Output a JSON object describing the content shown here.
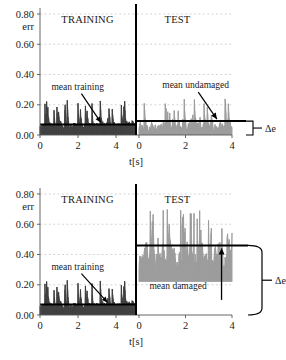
{
  "figure": {
    "width": 286,
    "height": 360,
    "background": "#ffffff"
  },
  "colors": {
    "training_trace": "#3a3a3a",
    "test_trace": "#9a9a9a",
    "mean_line": "#000000",
    "axis": "#555555",
    "grid": "#bbbbbb",
    "text": "#1a1a1a",
    "divider": "#000000"
  },
  "chart_data": [
    {
      "id": "top",
      "type": "line",
      "title": "",
      "xlabel": "t[s]",
      "ylabel": "err",
      "ylim": [
        0.0,
        0.8
      ],
      "yticks": [
        0.0,
        0.2,
        0.4,
        0.6,
        0.8
      ],
      "ytick_labels": [
        "0.00",
        "0.20",
        "0.40",
        "0.60",
        "0.80"
      ],
      "grid": true,
      "legend": "none",
      "segments": [
        {
          "name": "TRAINING",
          "label": "TRAINING",
          "xlim": [
            0,
            5
          ],
          "xticks": [
            0,
            2,
            4
          ],
          "xtick_labels": [
            "0",
            "2",
            "4"
          ],
          "trace_color": "#3a3a3a",
          "noise_seed": 17,
          "noise_base": 0.035,
          "noise_amplitude": 0.115,
          "noise_spike_chance": 0.12,
          "noise_spike_max": 0.23,
          "mean_value": 0.07,
          "mean_label": "mean training"
        },
        {
          "name": "TEST",
          "label": "TEST",
          "xlim": [
            0,
            4
          ],
          "xticks": [
            0,
            2,
            4
          ],
          "xtick_labels": [
            "0",
            "2",
            "4"
          ],
          "trace_color": "#9a9a9a",
          "noise_seed": 41,
          "noise_base": 0.005,
          "noise_amplitude": 0.185,
          "noise_spike_chance": 0.18,
          "noise_spike_max": 0.245,
          "mean_value": 0.092,
          "mean_label": "mean undamaged"
        }
      ],
      "annotations": [
        {
          "id": "mean-training",
          "text": "mean training",
          "x": 0.6,
          "y": 0.3
        },
        {
          "id": "mean-undamaged",
          "text": "mean undamaged",
          "x": 1.0,
          "y": 0.31
        }
      ],
      "delta": {
        "label": "Δe",
        "from": 0.0,
        "to": 0.092,
        "bracket": "small"
      }
    },
    {
      "id": "bottom",
      "type": "line",
      "title": "",
      "xlabel": "t[s]",
      "ylabel": "err",
      "ylim": [
        0.0,
        0.8
      ],
      "yticks": [
        0.0,
        0.2,
        0.4,
        0.6,
        0.8
      ],
      "ytick_labels": [
        "0.00",
        "0.20",
        "0.40",
        "0.60",
        "0.80"
      ],
      "grid": true,
      "legend": "none",
      "segments": [
        {
          "name": "TRAINING",
          "label": "TRAINING",
          "xlim": [
            0,
            5
          ],
          "xticks": [
            0,
            2,
            4
          ],
          "xtick_labels": [
            "0",
            "2",
            "4"
          ],
          "trace_color": "#3a3a3a",
          "noise_seed": 17,
          "noise_base": 0.035,
          "noise_amplitude": 0.115,
          "noise_spike_chance": 0.12,
          "noise_spike_max": 0.23,
          "mean_value": 0.07,
          "mean_label": "mean training"
        },
        {
          "name": "TEST",
          "label": "TEST",
          "xlim": [
            0,
            4
          ],
          "xticks": [
            0,
            2,
            4
          ],
          "xtick_labels": [
            "0",
            "2",
            "4"
          ],
          "trace_color": "#9a9a9a",
          "noise_seed": 93,
          "noise_base": 0.28,
          "noise_amplitude": 0.4,
          "noise_spike_chance": 0.22,
          "noise_spike_max": 0.7,
          "mean_value": 0.46,
          "mean_label": "mean damaged"
        }
      ],
      "annotations": [
        {
          "id": "mean-training",
          "text": "mean training",
          "x": 0.6,
          "y": 0.3
        },
        {
          "id": "mean-damaged",
          "text": "mean damaged",
          "x": 0.45,
          "y": 0.175
        }
      ],
      "delta": {
        "label": "Δe",
        "from": 0.0,
        "to": 0.46,
        "bracket": "large"
      }
    }
  ]
}
